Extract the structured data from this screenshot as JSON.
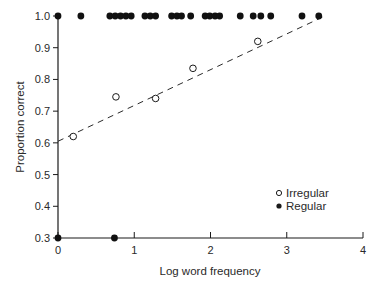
{
  "chart_data": {
    "type": "scatter",
    "title": "",
    "xlabel": "Log word frequency",
    "ylabel": "Proportion correct",
    "xlim": [
      0,
      4
    ],
    "ylim": [
      0.3,
      1.0
    ],
    "x_ticks": [
      "0",
      "1",
      "2",
      "3",
      "4"
    ],
    "y_ticks": [
      "0.3",
      "0.4",
      "0.5",
      "0.6",
      "0.7",
      "0.8",
      "0.9",
      "1.0"
    ],
    "grid": false,
    "legend_position": "lower right",
    "series": [
      {
        "name": "Irregular",
        "marker": "open-circle",
        "points": [
          {
            "x": 0.2,
            "y": 0.62
          },
          {
            "x": 0.76,
            "y": 0.745
          },
          {
            "x": 1.28,
            "y": 0.74
          },
          {
            "x": 1.77,
            "y": 0.835
          },
          {
            "x": 2.62,
            "y": 0.92
          }
        ]
      },
      {
        "name": "Regular",
        "marker": "filled-circle",
        "points": [
          {
            "x": 0.0,
            "y": 1.0
          },
          {
            "x": 0.3,
            "y": 1.0
          },
          {
            "x": 0.68,
            "y": 1.0
          },
          {
            "x": 0.75,
            "y": 1.0
          },
          {
            "x": 0.82,
            "y": 1.0
          },
          {
            "x": 0.89,
            "y": 1.0
          },
          {
            "x": 0.96,
            "y": 1.0
          },
          {
            "x": 1.14,
            "y": 1.0
          },
          {
            "x": 1.21,
            "y": 1.0
          },
          {
            "x": 1.28,
            "y": 1.0
          },
          {
            "x": 1.49,
            "y": 1.0
          },
          {
            "x": 1.56,
            "y": 1.0
          },
          {
            "x": 1.62,
            "y": 1.0
          },
          {
            "x": 1.74,
            "y": 1.0
          },
          {
            "x": 1.93,
            "y": 1.0
          },
          {
            "x": 1.99,
            "y": 1.0
          },
          {
            "x": 2.06,
            "y": 1.0
          },
          {
            "x": 2.12,
            "y": 1.0
          },
          {
            "x": 2.39,
            "y": 1.0
          },
          {
            "x": 2.56,
            "y": 1.0
          },
          {
            "x": 2.66,
            "y": 1.0
          },
          {
            "x": 2.79,
            "y": 1.0
          },
          {
            "x": 3.2,
            "y": 1.0
          },
          {
            "x": 3.42,
            "y": 1.0
          },
          {
            "x": 0.0,
            "y": 0.3
          },
          {
            "x": 0.74,
            "y": 0.3
          }
        ]
      }
    ],
    "fit_line": {
      "series": "Irregular",
      "style": "dashed",
      "x_start": 0.0,
      "y_start": 0.605,
      "x_end": 3.5,
      "y_end": 1.0
    }
  },
  "legend": {
    "items": [
      {
        "label": "Irregular",
        "marker": "open-circle"
      },
      {
        "label": "Regular",
        "marker": "filled-circle"
      }
    ]
  },
  "axes": {
    "x_title": "Log word frequency",
    "y_title": "Proportion correct"
  }
}
